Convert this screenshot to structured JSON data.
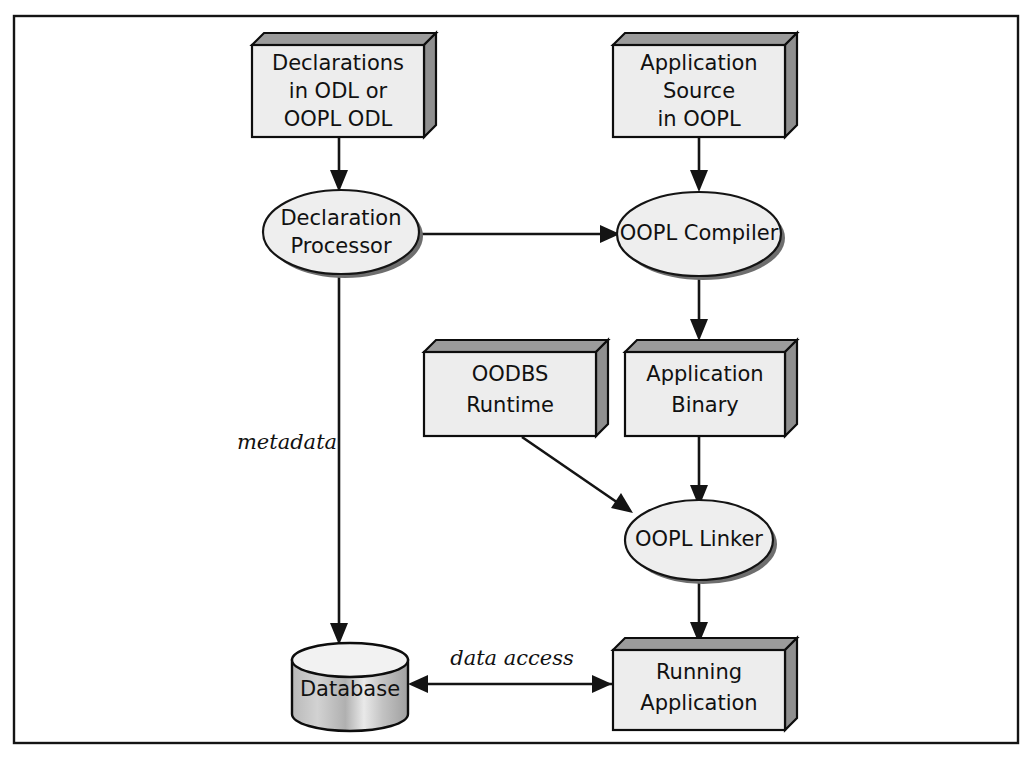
{
  "diagram": {
    "frame": {
      "visible": true,
      "color": "#141414"
    },
    "background_color": "#ffffff",
    "nodes": [
      {
        "id": "declarations",
        "shape": "box3d",
        "label": "Declarations\nin ODL or\nOOPL ODL",
        "lines": [
          "Declarations",
          "in ODL or",
          "OOPL ODL"
        ]
      },
      {
        "id": "app-source",
        "shape": "box3d",
        "label": "Application\nSource\nin OOPL",
        "lines": [
          "Application",
          "Source",
          "in OOPL"
        ]
      },
      {
        "id": "decl-processor",
        "shape": "ellipse",
        "label": "Declaration\nProcessor",
        "lines": [
          "Declaration",
          "Processor"
        ]
      },
      {
        "id": "oopl-compiler",
        "shape": "ellipse",
        "label": "OOPL Compiler",
        "lines": [
          "OOPL Compiler"
        ]
      },
      {
        "id": "oodbs-runtime",
        "shape": "box3d",
        "label": "OODBS\nRuntime",
        "lines": [
          "OODBS",
          "Runtime"
        ]
      },
      {
        "id": "app-binary",
        "shape": "box3d",
        "label": "Application\nBinary",
        "lines": [
          "Application",
          "Binary"
        ]
      },
      {
        "id": "oopl-linker",
        "shape": "ellipse",
        "label": "OOPL Linker",
        "lines": [
          "OOPL Linker"
        ]
      },
      {
        "id": "database",
        "shape": "cylinder",
        "label": "Database",
        "lines": [
          "Database"
        ]
      },
      {
        "id": "running-app",
        "shape": "box3d",
        "label": "Running\nApplication",
        "lines": [
          "Running",
          "Application"
        ]
      }
    ],
    "edges": [
      {
        "id": "e1",
        "from": "declarations",
        "to": "decl-processor",
        "label": "",
        "arrow": true
      },
      {
        "id": "e2",
        "from": "app-source",
        "to": "oopl-compiler",
        "label": "",
        "arrow": true
      },
      {
        "id": "e3",
        "from": "decl-processor",
        "to": "oopl-compiler",
        "label": "",
        "arrow": true
      },
      {
        "id": "e4",
        "from": "oopl-compiler",
        "to": "app-binary",
        "label": "",
        "arrow": true
      },
      {
        "id": "e5",
        "from": "decl-processor",
        "to": "database",
        "label": "metadata",
        "arrow": true
      },
      {
        "id": "e6",
        "from": "oodbs-runtime",
        "to": "oopl-linker",
        "label": "",
        "arrow": true
      },
      {
        "id": "e7",
        "from": "app-binary",
        "to": "oopl-linker",
        "label": "",
        "arrow": true
      },
      {
        "id": "e8",
        "from": "oopl-linker",
        "to": "running-app",
        "label": "",
        "arrow": true
      },
      {
        "id": "e9",
        "from": "running-app",
        "to": "database",
        "label": "data access",
        "arrow": true
      }
    ],
    "edge_labels": {
      "metadata": "metadata",
      "data_access": "data access"
    },
    "node_text": {
      "declarations_l1": "Declarations",
      "declarations_l2": "in ODL or",
      "declarations_l3": "OOPL ODL",
      "app_source_l1": "Application",
      "app_source_l2": "Source",
      "app_source_l3": "in OOPL",
      "decl_processor_l1": "Declaration",
      "decl_processor_l2": "Processor",
      "oopl_compiler_l1": "OOPL Compiler",
      "oodbs_runtime_l1": "OODBS",
      "oodbs_runtime_l2": "Runtime",
      "app_binary_l1": "Application",
      "app_binary_l2": "Binary",
      "oopl_linker_l1": "OOPL Linker",
      "database_l1": "Database",
      "running_app_l1": "Running",
      "running_app_l2": "Application"
    },
    "colors": {
      "box_face": "#ededed",
      "box_shadow": "#959595",
      "ellipse_face": "#eeeeee",
      "ellipse_shadow": "#6e6e6e",
      "line": "#141414",
      "text": "#111111"
    }
  }
}
